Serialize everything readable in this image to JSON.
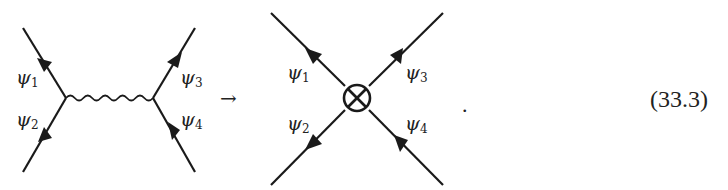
{
  "equation": {
    "number": "(33.3)",
    "arrow": "→",
    "terminator": "."
  },
  "left_diagram": {
    "description": "Four-fermion exchange via gauge boson (wavy propagator)",
    "labels": {
      "psi1": {
        "symbol": "ψ",
        "sub": "1"
      },
      "psi2": {
        "symbol": "ψ",
        "sub": "2"
      },
      "psi3": {
        "symbol": "ψ",
        "sub": "3"
      },
      "psi4": {
        "symbol": "ψ",
        "sub": "4"
      }
    },
    "propagator": "wavy"
  },
  "right_diagram": {
    "description": "Effective four-fermion contact interaction",
    "vertex_symbol": "⊗",
    "labels": {
      "psi1": {
        "symbol": "ψ",
        "sub": "1"
      },
      "psi2": {
        "symbol": "ψ",
        "sub": "2"
      },
      "psi3": {
        "symbol": "ψ",
        "sub": "3"
      },
      "psi4": {
        "symbol": "ψ",
        "sub": "4"
      }
    }
  },
  "colors": {
    "ink": "#1a1a1a",
    "background": "#ffffff"
  }
}
